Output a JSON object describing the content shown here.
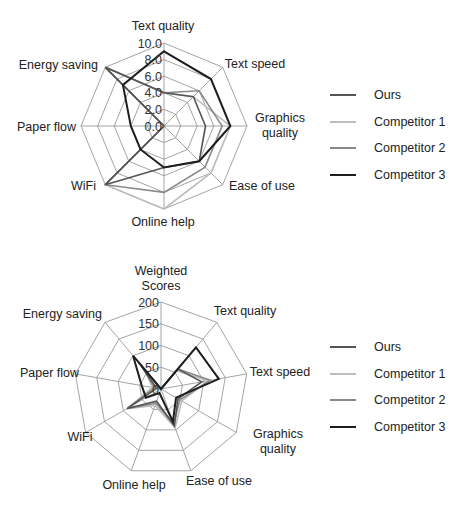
{
  "chart_data": [
    {
      "type": "radar",
      "title": "",
      "axes": [
        "Text quality",
        "Text speed",
        "Graphics quality",
        "Ease of use",
        "Online help",
        "WiFi",
        "Paper flow",
        "Energy saving"
      ],
      "axis_labels": [
        [
          "Text quality"
        ],
        [
          "Text speed"
        ],
        [
          "Graphics",
          "quality"
        ],
        [
          "Ease of use"
        ],
        [
          "Online help"
        ],
        [
          "WiFi"
        ],
        [
          "Paper flow"
        ],
        [
          "Energy saving"
        ]
      ],
      "tick_labels": [
        "0.0",
        "2.0",
        "4.0",
        "6.0",
        "8.0",
        "10.0"
      ],
      "range": [
        0,
        10
      ],
      "grid": true,
      "legend_position": "right",
      "series": [
        {
          "name": "Ours",
          "color": "#555555",
          "values": [
            4,
            5,
            5,
            6,
            5,
            10,
            0,
            10
          ]
        },
        {
          "name": "Competitor 1",
          "color": "#bdbdbd",
          "values": [
            4,
            5,
            8,
            8,
            10,
            10,
            0,
            10
          ]
        },
        {
          "name": "Competitor 2",
          "color": "#8a8a8a",
          "values": [
            4,
            6,
            7,
            7,
            8,
            10,
            0,
            10
          ]
        },
        {
          "name": "Competitor 3",
          "color": "#1e1e1e",
          "values": [
            9,
            8,
            8,
            6,
            5,
            4,
            4,
            7
          ]
        }
      ]
    },
    {
      "type": "radar",
      "title": "",
      "axes": [
        "Weighted Scores",
        "Text quality",
        "Text speed",
        "Graphics quality",
        "Ease of use",
        "Online help",
        "WiFi",
        "Paper flow",
        "Energy saving"
      ],
      "axis_labels": [
        [
          "Weighted",
          "Scores"
        ],
        [
          "Text quality"
        ],
        [
          "Text speed"
        ],
        [
          "Graphics",
          "quality"
        ],
        [
          "Ease of use"
        ],
        [
          "Online help"
        ],
        [
          "WiFi"
        ],
        [
          "Paper flow"
        ],
        [
          "Energy saving"
        ]
      ],
      "tick_labels": [
        "0",
        "50",
        "100",
        "150",
        "200"
      ],
      "range": [
        0,
        200
      ],
      "grid": true,
      "legend_position": "right",
      "series": [
        {
          "name": "Ours",
          "color": "#555555",
          "values": [
            0,
            60,
            95,
            45,
            90,
            30,
            90,
            10,
            80
          ]
        },
        {
          "name": "Competitor 1",
          "color": "#bdbdbd",
          "values": [
            0,
            55,
            110,
            55,
            95,
            40,
            90,
            20,
            60
          ]
        },
        {
          "name": "Competitor 2",
          "color": "#8a8a8a",
          "values": [
            0,
            60,
            115,
            50,
            85,
            35,
            90,
            15,
            70
          ]
        },
        {
          "name": "Competitor 3",
          "color": "#1e1e1e",
          "values": [
            0,
            125,
            135,
            40,
            80,
            10,
            40,
            45,
            100
          ]
        }
      ]
    }
  ],
  "legends": [
    {
      "items": [
        {
          "label": "Ours",
          "color": "#555555"
        },
        {
          "label": "Competitor 1",
          "color": "#bdbdbd"
        },
        {
          "label": "Competitor 2",
          "color": "#8a8a8a"
        },
        {
          "label": "Competitor 3",
          "color": "#1e1e1e"
        }
      ]
    },
    {
      "items": [
        {
          "label": "Ours",
          "color": "#555555"
        },
        {
          "label": "Competitor 1",
          "color": "#bdbdbd"
        },
        {
          "label": "Competitor 2",
          "color": "#8a8a8a"
        },
        {
          "label": "Competitor 3",
          "color": "#1e1e1e"
        }
      ]
    }
  ]
}
